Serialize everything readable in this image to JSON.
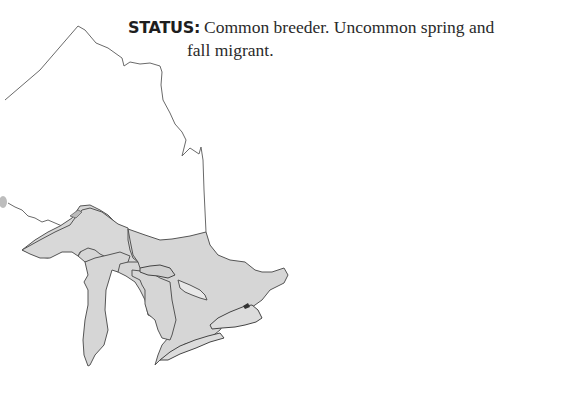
{
  "status": {
    "label": "STATUS:",
    "line1": "Common breeder. Uncommon spring and",
    "line2": "fall migrant."
  },
  "map": {
    "region": "Ontario and Great Lakes range map",
    "fill_color": "#d6d6d6",
    "outline_color": "#555555",
    "border_color": "#6a6a6a"
  }
}
